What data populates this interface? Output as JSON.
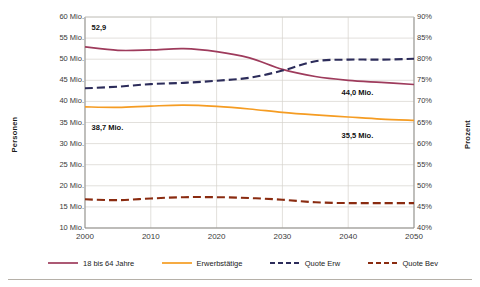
{
  "chart_data": {
    "type": "line",
    "title": "",
    "subtitle": "",
    "xlabel": "",
    "ylabel": "Personen",
    "ylabel_secondary": "Prozent",
    "x": [
      2000,
      2005,
      2010,
      2015,
      2020,
      2025,
      2030,
      2035,
      2040,
      2045,
      2050
    ],
    "xlim": [
      2000,
      2050
    ],
    "ylim": [
      10,
      60
    ],
    "ylim_secondary": [
      40,
      90
    ],
    "grid": true,
    "legend_position": "bottom",
    "xticks": [
      "2000",
      "2010",
      "2020",
      "2030",
      "2040",
      "2050"
    ],
    "yticks_left": [
      "60 Mio.",
      "55 Mio.",
      "50 Mio.",
      "45 Mio.",
      "40 Mio.",
      "35 Mio.",
      "30 Mio.",
      "25 Mio.",
      "20 Mio.",
      "15 Mio.",
      "10 Mio."
    ],
    "yticks_right": [
      "90%",
      "85%",
      "80%",
      "75%",
      "70%",
      "65%",
      "60%",
      "55%",
      "50%",
      "45%",
      "40%"
    ],
    "series": [
      {
        "name": "18 bis 64 Jahre",
        "axis": "left",
        "color": "#9e3b5c",
        "style": "solid",
        "values": [
          52.9,
          52.1,
          52.2,
          52.5,
          51.8,
          50.3,
          47.6,
          45.9,
          45.0,
          44.5,
          44.0
        ]
      },
      {
        "name": "Erwerbstätige",
        "axis": "left",
        "color": "#f59c22",
        "style": "solid",
        "values": [
          38.7,
          38.6,
          38.9,
          39.1,
          38.8,
          38.2,
          37.4,
          36.8,
          36.3,
          35.8,
          35.5
        ]
      },
      {
        "name": "Quote Erw",
        "axis": "right",
        "color": "#2c2c5a",
        "style": "dashed",
        "values": [
          73.1,
          73.5,
          74.1,
          74.4,
          74.9,
          75.6,
          77.3,
          79.5,
          79.9,
          79.9,
          80.1
        ]
      },
      {
        "name": "Quote Bev",
        "axis": "right",
        "color": "#8a2b10",
        "style": "dashed",
        "values": [
          46.8,
          46.6,
          47.0,
          47.3,
          47.3,
          47.1,
          46.7,
          46.1,
          45.9,
          45.9,
          45.9
        ]
      }
    ],
    "annotations": [
      {
        "text": "52,9",
        "x": 2001,
        "y": 57.5,
        "series": "18 bis 64 Jahre"
      },
      {
        "text": "38,7 Mio.",
        "x": 2001,
        "y": 33.6,
        "series": "Erwerbstätige"
      },
      {
        "text": "44,0 Mio.",
        "x": 2039,
        "y": 42.0,
        "series": "18 bis 64 Jahre"
      },
      {
        "text": "35,5 Mio.",
        "x": 2039,
        "y": 31.8,
        "series": "Erwerbstätige"
      }
    ]
  },
  "axes": {
    "left_title": "Personen",
    "right_title": "Prozent"
  },
  "legend": {
    "items": [
      {
        "label": "18 bis 64 Jahre",
        "color": "#9e3b5c",
        "style": "solid"
      },
      {
        "label": "Erwerbstätige",
        "color": "#f59c22",
        "style": "solid"
      },
      {
        "label": "Quote Erw",
        "color": "#2c2c5a",
        "style": "dashed"
      },
      {
        "label": "Quote Bev",
        "color": "#8a2b10",
        "style": "dashed"
      }
    ]
  }
}
